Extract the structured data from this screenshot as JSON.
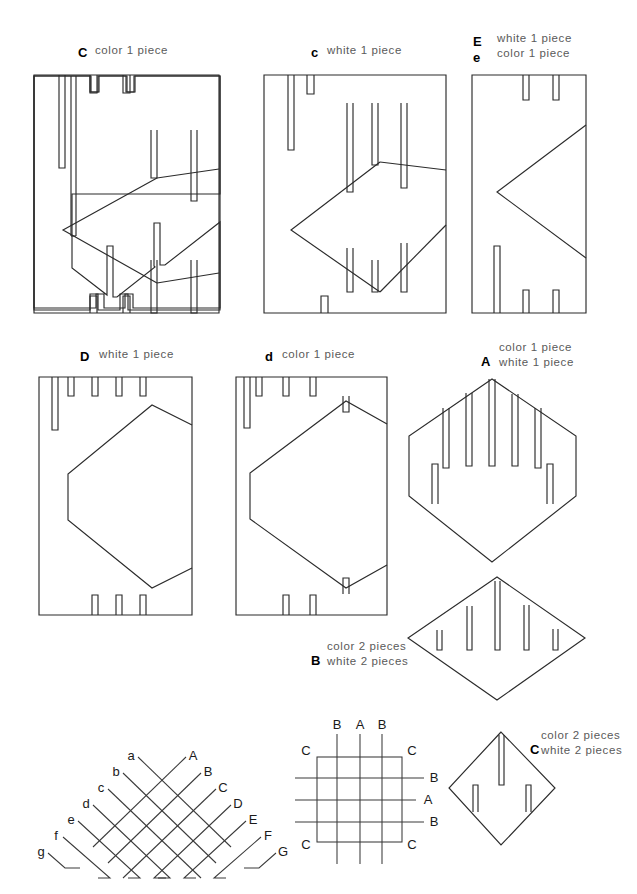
{
  "document": {
    "title": "Woven paper craft cutting pattern sheet",
    "type": "pattern-template-sheet"
  },
  "pieces": [
    {
      "id": "C-upper",
      "key": "C",
      "specs": [
        "color 1 piece"
      ],
      "shape": "rectangle-with-diamond-cutout",
      "key_x": 78,
      "key_y": 47,
      "spec_x": 95,
      "spec_y": 45
    },
    {
      "id": "c-lower",
      "key": "c",
      "specs": [
        "white 1 piece"
      ],
      "shape": "rectangle-with-diamond-cutout",
      "key_x": 311,
      "key_y": 47,
      "spec_x": 327,
      "spec_y": 45
    },
    {
      "id": "E-e",
      "key": "E",
      "key2": "e",
      "specs": [
        "white 1 piece",
        "color 1 piece"
      ],
      "shape": "rectangle-with-vee-notch",
      "key_x": 473,
      "key_y": 36,
      "key2_x": 473,
      "key2_y": 52,
      "spec_x": 497,
      "spec_y": 33
    },
    {
      "id": "D",
      "key": "D",
      "specs": [
        "white 1 piece"
      ],
      "shape": "rectangle-with-hex-cutout",
      "key_x": 80,
      "key_y": 351,
      "spec_x": 99,
      "spec_y": 349
    },
    {
      "id": "d",
      "key": "d",
      "specs": [
        "color 1 piece"
      ],
      "shape": "rectangle-with-hex-cutout",
      "key_x": 265,
      "key_y": 351,
      "spec_x": 282,
      "spec_y": 349
    },
    {
      "id": "A",
      "key": "A",
      "specs": [
        "color 1 piece",
        "white 1 piece"
      ],
      "shape": "hexagon-with-slits",
      "key_x": 481,
      "key_y": 356,
      "spec_x": 499,
      "spec_y": 342
    },
    {
      "id": "B",
      "key": "B",
      "specs": [
        "color 2 pieces",
        "white 2 pieces"
      ],
      "shape": "diamond-with-five-slits",
      "key_x": 311,
      "key_y": 655,
      "spec_x": 327,
      "spec_y": 641
    },
    {
      "id": "C-small",
      "key": "C",
      "specs": [
        "color 2 pieces",
        "white 2 pieces"
      ],
      "shape": "small-diamond-with-slits",
      "key_x": 530,
      "key_y": 744,
      "spec_x": 541,
      "spec_y": 730
    }
  ],
  "weave_diagram": {
    "name": "diagonal-weave-assembly",
    "left_labels": [
      "a",
      "b",
      "c",
      "d",
      "e",
      "f",
      "g"
    ],
    "right_labels": [
      "A",
      "B",
      "C",
      "D",
      "E",
      "F",
      "G"
    ],
    "left_positions": [
      {
        "label": "a",
        "x": 131,
        "y": 755
      },
      {
        "label": "b",
        "x": 116,
        "y": 771
      },
      {
        "label": "c",
        "x": 101,
        "y": 787
      },
      {
        "label": "d",
        "x": 86,
        "y": 803
      },
      {
        "label": "e",
        "x": 71,
        "y": 818
      },
      {
        "label": "f",
        "x": 56,
        "y": 834
      },
      {
        "label": "g",
        "x": 41,
        "y": 850
      }
    ],
    "right_positions": [
      {
        "label": "A",
        "x": 176,
        "y": 755
      },
      {
        "label": "B",
        "x": 191,
        "y": 771
      },
      {
        "label": "C",
        "x": 206,
        "y": 787
      },
      {
        "label": "D",
        "x": 221,
        "y": 803
      },
      {
        "label": "E",
        "x": 236,
        "y": 818
      },
      {
        "label": "F",
        "x": 251,
        "y": 834
      },
      {
        "label": "G",
        "x": 266,
        "y": 850
      }
    ]
  },
  "grid_diagram": {
    "name": "finished-weave-grid",
    "top_labels": [
      "B",
      "A",
      "B"
    ],
    "left_top_label": "C",
    "right_top_label": "C",
    "left_bottom_label": "C",
    "right_bottom_label": "C",
    "right_labels": [
      "B",
      "A",
      "B"
    ]
  }
}
